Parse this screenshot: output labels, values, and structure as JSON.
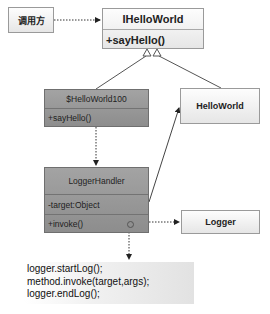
{
  "diagram": {
    "type": "uml-class-diagram",
    "nodes": {
      "caller": {
        "label": "调用方"
      },
      "ihelloworld": {
        "name": "IHelloWorld",
        "methods": [
          "+sayHello()"
        ]
      },
      "proxy": {
        "name": "$HelloWorld100",
        "methods": [
          "+sayHello()"
        ]
      },
      "helloworld": {
        "name": "HelloWorld"
      },
      "loggerhandler": {
        "name": "LoggerHandler",
        "attributes": [
          "-target:Object"
        ],
        "methods": [
          "+invoke()"
        ]
      },
      "logger": {
        "name": "Logger"
      }
    },
    "edges": [
      {
        "from": "调用方",
        "to": "IHelloWorld",
        "style": "dashed",
        "head": "filled-arrow"
      },
      {
        "from": "$HelloWorld100",
        "to": "IHelloWorld",
        "style": "solid",
        "head": "hollow-triangle"
      },
      {
        "from": "HelloWorld",
        "to": "IHelloWorld",
        "style": "solid",
        "head": "hollow-triangle"
      },
      {
        "from": "$HelloWorld100",
        "to": "LoggerHandler",
        "style": "dashed",
        "head": "filled-arrow"
      },
      {
        "from": "LoggerHandler",
        "to": "HelloWorld",
        "style": "solid",
        "head": "filled-arrow"
      },
      {
        "from": "LoggerHandler",
        "to": "Logger",
        "style": "dashed",
        "head": "filled-arrow"
      },
      {
        "from": "LoggerHandler.invoke()",
        "to": "note",
        "style": "dashed",
        "head": "filled-arrow"
      }
    ],
    "note": {
      "lines": [
        "logger.startLog();",
        "method.invoke(target,args);",
        "logger.endLog();"
      ]
    }
  }
}
